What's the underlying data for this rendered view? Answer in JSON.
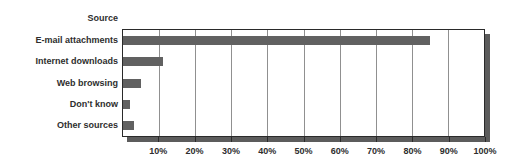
{
  "chart_data": {
    "type": "bar",
    "orientation": "horizontal",
    "axis_header": "Source",
    "categories": [
      "E-mail attachments",
      "Internet downloads",
      "Web browsing",
      "Don't know",
      "Other sources"
    ],
    "values": [
      85,
      11,
      5,
      2,
      3
    ],
    "x_tick_labels": [
      "10%",
      "20%",
      "30%",
      "40%",
      "50%",
      "60%",
      "70%",
      "80%",
      "90%",
      "100%"
    ],
    "x_tick_values": [
      10,
      20,
      30,
      40,
      50,
      60,
      70,
      80,
      90,
      100
    ],
    "xlim": [
      0,
      100
    ],
    "grid": true,
    "legend": false,
    "title": "",
    "xlabel": "",
    "ylabel": "",
    "colors": {
      "bar": "#616161",
      "shadow": "#5c5c5c",
      "gridline": "#909090",
      "plot_border": "#2a2a2a",
      "text": "#2e2e2e",
      "background": "#ffffff"
    }
  }
}
